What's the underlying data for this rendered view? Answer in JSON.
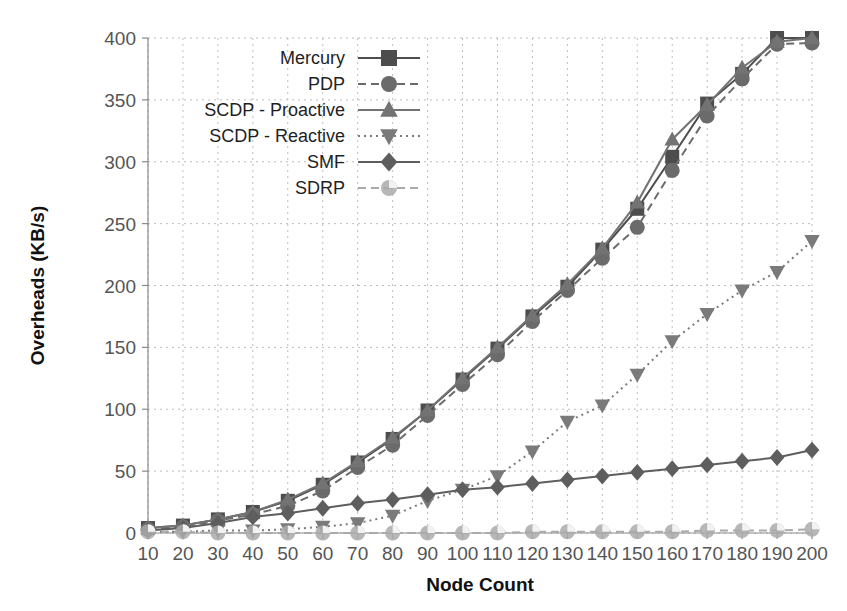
{
  "chart_data": {
    "type": "line",
    "title": "",
    "xlabel": "Node Count",
    "ylabel": "Overheads (KB/s)",
    "x": [
      10,
      20,
      30,
      40,
      50,
      60,
      70,
      80,
      90,
      100,
      110,
      120,
      130,
      140,
      150,
      160,
      170,
      180,
      190,
      200
    ],
    "xlim": [
      10,
      200
    ],
    "ylim": [
      0,
      400
    ],
    "xticks": [
      "10",
      "20",
      "30",
      "40",
      "50",
      "60",
      "70",
      "80",
      "90",
      "100",
      "110",
      "120",
      "130",
      "140",
      "150",
      "160",
      "170",
      "180",
      "190",
      "200"
    ],
    "yticks": [
      "0",
      "50",
      "100",
      "150",
      "200",
      "250",
      "300",
      "350",
      "400"
    ],
    "grid": true,
    "legend_position": "upper-left-inside",
    "series": [
      {
        "name": "Mercury",
        "marker": "square",
        "linestyle": "solid",
        "color": "#4d4d4d",
        "values": [
          4,
          6,
          11,
          17,
          26,
          39,
          57,
          76,
          99,
          124,
          149,
          175,
          199,
          229,
          262,
          304,
          347,
          371,
          400,
          400
        ]
      },
      {
        "name": "PDP",
        "marker": "circle",
        "linestyle": "dashed",
        "color": "#6b6b6b",
        "values": [
          3,
          5,
          10,
          15,
          22,
          34,
          53,
          71,
          95,
          120,
          144,
          171,
          196,
          222,
          247,
          293,
          337,
          367,
          395,
          396
        ]
      },
      {
        "name": "SCDP - Proactive",
        "marker": "triangle-up",
        "linestyle": "solid",
        "color": "#737373",
        "values": [
          4,
          6,
          11,
          17,
          27,
          40,
          58,
          77,
          99,
          125,
          150,
          176,
          201,
          230,
          267,
          318,
          346,
          376,
          397,
          400
        ]
      },
      {
        "name": "SCDP - Reactive",
        "marker": "triangle-down",
        "linestyle": "dotted",
        "color": "#7a7a7a",
        "values": [
          1,
          1,
          2,
          2,
          3,
          5,
          8,
          14,
          26,
          35,
          46,
          66,
          90,
          103,
          128,
          155,
          177,
          196,
          211,
          236
        ]
      },
      {
        "name": "SMF",
        "marker": "diamond",
        "linestyle": "solid",
        "color": "#5e5e5e",
        "values": [
          2,
          4,
          8,
          13,
          16,
          20,
          24,
          27,
          31,
          35,
          37,
          40,
          43,
          46,
          49,
          52,
          55,
          58,
          61,
          67
        ]
      },
      {
        "name": "SDRP",
        "marker": "circle-open",
        "linestyle": "dashed",
        "color": "#aaaaaa",
        "values": [
          1,
          1,
          0,
          0,
          0,
          0,
          0,
          0,
          0,
          0,
          0,
          1,
          1,
          1,
          1,
          1,
          2,
          2,
          2,
          3
        ]
      }
    ]
  },
  "colors": {
    "background": "#ffffff",
    "grid": "#bdbdbd",
    "axis": "#8a8a8a",
    "text": "#1f1f1f"
  }
}
